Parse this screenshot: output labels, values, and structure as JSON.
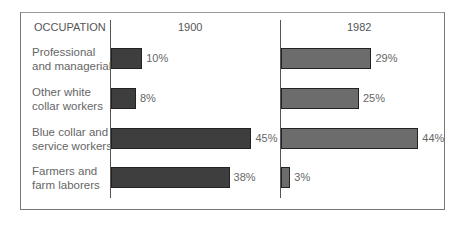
{
  "chart_data": {
    "type": "bar",
    "title": "",
    "category_header": "OCCUPATION",
    "categories": [
      "Professional and managerial",
      "Other white collar workers",
      "Blue collar and service workers",
      "Farmers and farm laborers"
    ],
    "category_lines": [
      [
        "Professional",
        "and managerial"
      ],
      [
        "Other white",
        "collar workers"
      ],
      [
        "Blue collar and",
        "service workers"
      ],
      [
        "Farmers and",
        "farm laborers"
      ]
    ],
    "series": [
      {
        "name": "1900",
        "values": [
          10,
          8,
          45,
          38
        ],
        "labels": [
          "10%",
          "8%",
          "45%",
          "38%"
        ],
        "color": "#3e3e3e"
      },
      {
        "name": "1982",
        "values": [
          29,
          25,
          44,
          3
        ],
        "labels": [
          "29%",
          "25%",
          "44%",
          "3%"
        ],
        "color": "#6c6c6c"
      }
    ],
    "xlabel": "",
    "ylabel": "",
    "grid": false,
    "orientation": "horizontal"
  }
}
